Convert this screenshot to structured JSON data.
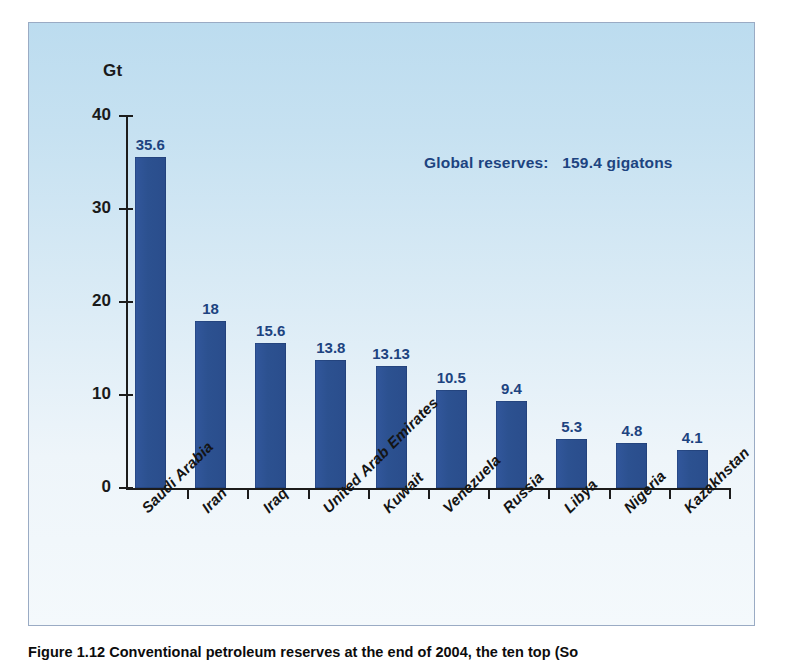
{
  "figure": {
    "caption": "Figure 1.12  Conventional petroleum reserves at the end of 2004, the ten top (So"
  },
  "axes": {
    "y_axis_title": "Gt",
    "y_ticks": [
      "40",
      "30",
      "20",
      "10",
      "0"
    ]
  },
  "annotation": {
    "text": "Global reserves:   159.4 gigatons"
  },
  "colors": {
    "bar_fill": "#2c5190",
    "bar_label": "#1d4380",
    "panel_top": "#bcdcef",
    "panel_bottom": "#f4f9fc",
    "axis": "#1c1c1c",
    "panel_border": "#9aabc4"
  },
  "chart_data": {
    "type": "bar",
    "title": "",
    "xlabel": "",
    "ylabel": "Gt",
    "ylim": [
      0,
      40
    ],
    "yticks": [
      0,
      10,
      20,
      30,
      40
    ],
    "grid": false,
    "legend": "none",
    "annotations": [
      "Global reserves:   159.4 gigatons"
    ],
    "categories": [
      "Saudi Arabia",
      "Iran",
      "Iraq",
      "United Arab Emirates",
      "Kuwait",
      "Venezuela",
      "Russia",
      "Libya",
      "Nigeria",
      "Kazakhstan"
    ],
    "values": [
      35.6,
      18,
      15.6,
      13.8,
      13.13,
      10.5,
      9.4,
      5.3,
      4.8,
      4.1
    ],
    "value_labels": [
      "35.6",
      "18",
      "15.6",
      "13.8",
      "13.13",
      "10.5",
      "9.4",
      "5.3",
      "4.8",
      "4.1"
    ]
  }
}
